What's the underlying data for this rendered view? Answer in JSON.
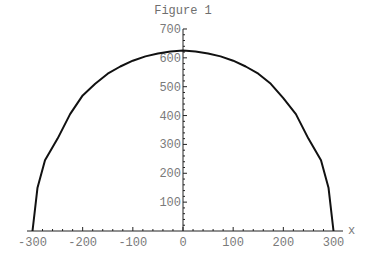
{
  "chart_data": {
    "type": "line",
    "title": "Figure 1",
    "xlabel": "x",
    "ylabel": "",
    "xlim": [
      -300,
      300
    ],
    "ylim": [
      0,
      700
    ],
    "grid": false,
    "legend": null,
    "x_ticks": [
      -300,
      -200,
      -100,
      0,
      100,
      200,
      300
    ],
    "x_tick_labels": [
      "-300",
      "-200",
      "-100",
      "0",
      "100",
      "200",
      "300"
    ],
    "x_minor_tick_step": 20,
    "y_ticks": [
      100,
      200,
      300,
      400,
      500,
      600,
      700
    ],
    "y_tick_labels": [
      "100",
      "200",
      "300",
      "400",
      "500",
      "600",
      "700"
    ],
    "y_minor_tick_step": 20,
    "series": [
      {
        "name": "curve",
        "color": "#111111",
        "x": [
          -300,
          -290,
          -275,
          -250,
          -225,
          -200,
          -175,
          -150,
          -125,
          -100,
          -75,
          -50,
          -25,
          0,
          25,
          50,
          75,
          100,
          125,
          150,
          175,
          200,
          225,
          250,
          275,
          290,
          300
        ],
        "y": [
          0,
          150,
          245,
          320,
          405,
          470,
          510,
          545,
          570,
          590,
          605,
          615,
          622,
          625,
          622,
          615,
          605,
          590,
          570,
          545,
          510,
          460,
          405,
          320,
          245,
          150,
          0
        ]
      }
    ],
    "annotations": []
  },
  "colors": {
    "curve": "#111111",
    "axis": "#222222",
    "text": "#7a7a7a",
    "background": "#ffffff"
  }
}
